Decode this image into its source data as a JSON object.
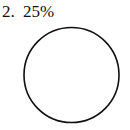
{
  "problem": {
    "number": "2.",
    "label": "25%"
  },
  "figure": {
    "shape": "circle",
    "stroke_color": "#111111",
    "fill_color": "#ffffff",
    "shaded_fraction": 0
  }
}
